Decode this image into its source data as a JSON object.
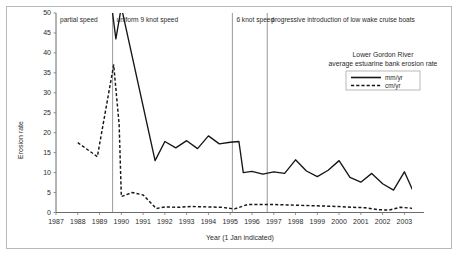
{
  "figure": {
    "border_color": "#b9b9b9"
  },
  "chart_data": {
    "type": "line",
    "title": "Lower Gordon River",
    "subtitle": "average estuarine bank erosion rate",
    "xlabel": "Year (1 Jan indicated)",
    "ylabel": "Erosion rate",
    "xlim": [
      1987,
      2003.9
    ],
    "ylim": [
      0,
      50
    ],
    "grid": false,
    "legend_position": "top-right-inside",
    "x_ticks": [
      1987,
      1988,
      1989,
      1990,
      1991,
      1992,
      1993,
      1994,
      1995,
      1996,
      1997,
      1998,
      1999,
      2000,
      2001,
      2002,
      2003
    ],
    "x_tick_labels": [
      "1987",
      "1988",
      "1989",
      "1990",
      "1991",
      "1992",
      "1993",
      "1994",
      "1995",
      "1996",
      "1997",
      "1998",
      "1999",
      "2000",
      "2001",
      "2002",
      "2003"
    ],
    "y_ticks": [
      0,
      5,
      10,
      15,
      20,
      25,
      30,
      35,
      40,
      45,
      50
    ],
    "y_tick_labels": [
      "0",
      "5",
      "10",
      "15",
      "20",
      "25",
      "30",
      "35",
      "40",
      "45",
      "50"
    ],
    "series": [
      {
        "name": "mm/yr",
        "style": "solid",
        "color": "#161616",
        "x": [
          1989.55,
          1989.75,
          1990.0,
          1991.55,
          1992.0,
          1992.5,
          1993.0,
          1993.5,
          1994.0,
          1994.5,
          1995.0,
          1995.4,
          1995.6,
          1996.0,
          1996.5,
          1997.0,
          1997.5,
          1998.0,
          1998.5,
          1999.0,
          1999.5,
          2000.0,
          2000.5,
          2001.0,
          2001.5,
          2002.0,
          2002.5,
          2003.0,
          2003.5
        ],
        "values": [
          52.0,
          43.5,
          51.5,
          13.0,
          17.8,
          16.2,
          18.0,
          16.0,
          19.2,
          17.2,
          17.6,
          17.8,
          10.0,
          10.3,
          9.6,
          10.2,
          9.8,
          13.2,
          10.4,
          9.0,
          10.6,
          13.0,
          8.8,
          7.6,
          9.8,
          7.2,
          5.6,
          10.2,
          4.2
        ]
      },
      {
        "name": "cm/yr",
        "style": "dashed",
        "color": "#161616",
        "x": [
          1988.0,
          1988.9,
          1989.65,
          1989.9,
          1990.0,
          1990.5,
          1991.0,
          1991.6,
          1992.0,
          1992.6,
          1993.2,
          1994.0,
          1994.6,
          1995.2,
          1995.8,
          1996.4,
          1997.0,
          1997.6,
          1998.2,
          1998.8,
          1999.4,
          2000.0,
          2000.6,
          2001.2,
          2001.8,
          2002.3,
          2002.8,
          2003.3,
          2003.6
        ],
        "values": [
          17.5,
          14.0,
          37.0,
          22.0,
          4.0,
          5.0,
          4.4,
          1.0,
          1.4,
          1.3,
          1.5,
          1.4,
          1.3,
          0.9,
          2.0,
          2.0,
          2.0,
          1.9,
          1.8,
          1.7,
          1.6,
          1.5,
          1.3,
          1.2,
          0.7,
          0.6,
          1.3,
          1.1,
          0.6
        ]
      }
    ],
    "annotations": [
      {
        "label": "partial speed",
        "x_start": 1987.0,
        "x_end": 1989.6
      },
      {
        "label": "uniform 9 knot speed",
        "x_start": 1989.6,
        "x_end": 1995.1
      },
      {
        "label": "6 knot speed",
        "x_start": 1995.1,
        "x_end": 1996.7
      },
      {
        "label": "progressive introduction of low wake cruise boats",
        "x_start": 1996.7,
        "x_end": 2003.9
      }
    ],
    "dividers": [
      1989.6,
      1995.1,
      1996.7
    ]
  }
}
